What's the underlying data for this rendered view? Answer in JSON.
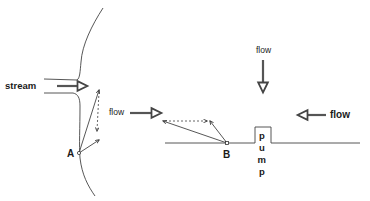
{
  "diagram": {
    "left_panel": {
      "stream_label": "stream",
      "flow_label": "flow",
      "point_label": "A"
    },
    "right_panel": {
      "flow_top_label": "flow",
      "flow_right_label": "flow",
      "point_label": "B",
      "pump_letters": [
        "p",
        "u",
        "m",
        "p"
      ]
    }
  }
}
